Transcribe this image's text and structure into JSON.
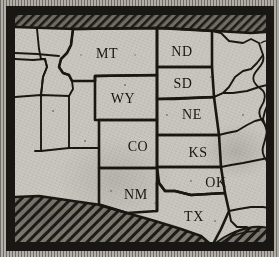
{
  "map": {
    "title": "Western United States",
    "style": "engraved-halftone",
    "frame": {
      "outer_color": "#191714",
      "paper_color": "#c6c3bc",
      "margin_color": "#a9a69f"
    },
    "ink_color": "#17150f",
    "land_color": "#c9c6bf",
    "hatch_color": "#22201a",
    "labels": [
      {
        "id": "MT",
        "text": "MT",
        "x": 92,
        "y": 40
      },
      {
        "id": "ND",
        "text": "ND",
        "x": 167,
        "y": 38
      },
      {
        "id": "SD",
        "text": "SD",
        "x": 168,
        "y": 70
      },
      {
        "id": "WY",
        "text": "WY",
        "x": 108,
        "y": 85
      },
      {
        "id": "NE",
        "text": "NE",
        "x": 177,
        "y": 101
      },
      {
        "id": "CO",
        "text": "CO",
        "x": 123,
        "y": 133
      },
      {
        "id": "KS",
        "text": "KS",
        "x": 183,
        "y": 139
      },
      {
        "id": "NM",
        "text": "NM",
        "x": 121,
        "y": 181
      },
      {
        "id": "OK",
        "text": "OK",
        "x": 201,
        "y": 169
      },
      {
        "id": "TX",
        "text": "TX",
        "x": 179,
        "y": 203
      }
    ],
    "hatched_regions": [
      {
        "id": "canada",
        "name": "Canada (hatched border band)",
        "position": "top"
      },
      {
        "id": "mexico",
        "name": "Mexico (hatched border band)",
        "position": "bottom-left"
      },
      {
        "id": "gulf",
        "name": "Gulf of Mexico (hatched water)",
        "position": "bottom-right"
      }
    ],
    "unlabeled_states": [
      "Washington",
      "Oregon",
      "Idaho",
      "Nevada",
      "Utah",
      "Arizona",
      "Minnesota",
      "Iowa",
      "Missouri",
      "Arkansas",
      "Louisiana"
    ]
  }
}
